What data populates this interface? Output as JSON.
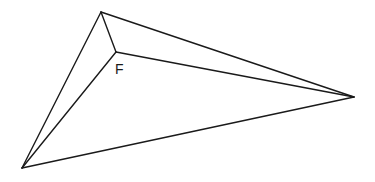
{
  "diagram": {
    "type": "geometry-figure",
    "stroke_color": "#1a1a1a",
    "background": "#ffffff",
    "vertices": {
      "top": {
        "x": 101,
        "y": 12
      },
      "right": {
        "x": 354,
        "y": 97
      },
      "bottom_left": {
        "x": 22,
        "y": 168
      },
      "F": {
        "x": 116,
        "y": 52
      }
    },
    "edges": [
      [
        "top",
        "right"
      ],
      [
        "top",
        "bottom_left"
      ],
      [
        "bottom_left",
        "right"
      ],
      [
        "F",
        "top"
      ],
      [
        "F",
        "right"
      ],
      [
        "F",
        "bottom_left"
      ]
    ],
    "labels": [
      {
        "text": "F",
        "x": 115,
        "y": 74
      }
    ]
  }
}
